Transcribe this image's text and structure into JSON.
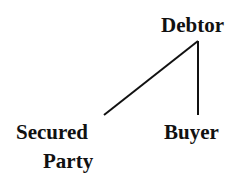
{
  "diagram": {
    "type": "tree",
    "nodes": {
      "root": {
        "label": "Debtor"
      },
      "left": {
        "label_line1": "Secured",
        "label_line2": "Party"
      },
      "right": {
        "label": "Buyer"
      }
    },
    "edges": [
      {
        "from": "Debtor",
        "to": "Secured Party"
      },
      {
        "from": "Debtor",
        "to": "Buyer"
      }
    ],
    "line_color": "#111111"
  }
}
